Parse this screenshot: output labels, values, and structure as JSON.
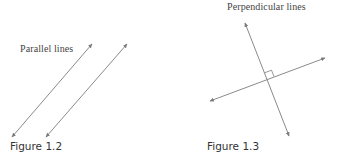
{
  "figures": [
    {
      "id": "figure-1-2",
      "label": "Parallel lines",
      "caption": "Figure 1.2",
      "lines": [
        {
          "x1": 12,
          "y1": 137,
          "x2": 92,
          "y2": 44,
          "arrows": "both"
        },
        {
          "x1": 46,
          "y1": 137,
          "x2": 127,
          "y2": 44,
          "arrows": "both"
        }
      ]
    },
    {
      "id": "figure-1-3",
      "label": "Perpendicular lines",
      "caption": "Figure 1.3",
      "lines": [
        {
          "x1": 75,
          "y1": 23,
          "x2": 119,
          "y2": 136,
          "arrows": "both"
        },
        {
          "x1": 40,
          "y1": 101,
          "x2": 155,
          "y2": 58,
          "arrows": "both"
        }
      ],
      "right_angle_marker": true
    }
  ],
  "colors": {
    "line": "#8a8a8a",
    "arrowhead": "#7a7a7a",
    "text": "#444444"
  }
}
